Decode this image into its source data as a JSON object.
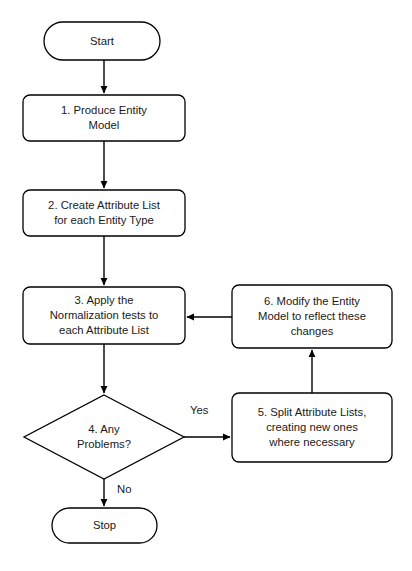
{
  "diagram": {
    "type": "flowchart",
    "background_color": "#ffffff",
    "stroke_color": "#000000",
    "text_color": "#1a1a1a",
    "nodes": [
      {
        "id": "start",
        "shape": "terminator",
        "text": "Start",
        "x": 44,
        "y": 22,
        "w": 116,
        "h": 38
      },
      {
        "id": "step1",
        "shape": "process",
        "text": "1.   Produce Entity\nModel",
        "x": 23,
        "y": 95,
        "w": 162,
        "h": 46
      },
      {
        "id": "step2",
        "shape": "process",
        "text": "2. Create Attribute List\nfor each Entity Type",
        "x": 23,
        "y": 190,
        "w": 162,
        "h": 46
      },
      {
        "id": "step3",
        "shape": "process",
        "text": "3. Apply the\nNormalization tests to\neach Attribute List",
        "x": 23,
        "y": 287,
        "w": 162,
        "h": 57
      },
      {
        "id": "step4",
        "shape": "decision",
        "text": "4. Any\nProblems?",
        "x": 24,
        "y": 395,
        "w": 160,
        "h": 84
      },
      {
        "id": "step5",
        "shape": "process",
        "text": "5. Split Attribute Lists,\ncreating new ones\nwhere necessary",
        "x": 232,
        "y": 393,
        "w": 160,
        "h": 69
      },
      {
        "id": "step6",
        "shape": "process",
        "text": "6. Modify the Entity\nModel to reflect these\nchanges",
        "x": 232,
        "y": 285,
        "w": 160,
        "h": 63
      },
      {
        "id": "stop",
        "shape": "terminator",
        "text": "Stop",
        "x": 52,
        "y": 508,
        "w": 105,
        "h": 35
      }
    ],
    "edges": [
      {
        "id": "e-start-1",
        "from": "start",
        "to": "step1",
        "label": ""
      },
      {
        "id": "e-1-2",
        "from": "step1",
        "to": "step2",
        "label": ""
      },
      {
        "id": "e-2-3",
        "from": "step2",
        "to": "step3",
        "label": ""
      },
      {
        "id": "e-3-4",
        "from": "step3",
        "to": "step4",
        "label": ""
      },
      {
        "id": "e-4-5",
        "from": "step4",
        "to": "step5",
        "label": "Yes"
      },
      {
        "id": "e-4-stop",
        "from": "step4",
        "to": "stop",
        "label": "No"
      },
      {
        "id": "e-5-6",
        "from": "step5",
        "to": "step6",
        "label": ""
      },
      {
        "id": "e-6-3",
        "from": "step6",
        "to": "step3",
        "label": ""
      }
    ],
    "edge_labels": {
      "yes": "Yes",
      "no": "No"
    }
  }
}
